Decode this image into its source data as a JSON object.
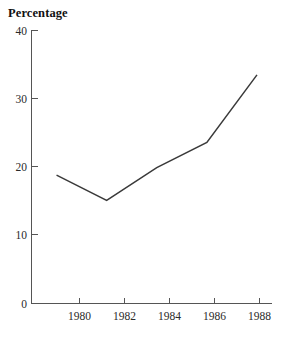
{
  "chart_data": {
    "type": "line",
    "title": "",
    "ylabel": "Percentage",
    "xlabel": "",
    "categories": [
      "1980",
      "1982",
      "1984",
      "1986",
      "1988"
    ],
    "x": [
      1980,
      1982,
      1984,
      1986,
      1988
    ],
    "values": [
      18.8,
      15.1,
      19.9,
      23.6,
      33.5
    ],
    "series": [
      {
        "name": "Percentage",
        "values": [
          18.8,
          15.1,
          19.9,
          23.6,
          33.5
        ]
      }
    ],
    "xlim": [
      1979.0,
      1988.6
    ],
    "ylim": [
      0,
      40
    ],
    "yticks": [
      0,
      10,
      20,
      30,
      40
    ],
    "ytick_labels": [
      "0",
      "10",
      "20",
      "30",
      "40"
    ],
    "xticks": [
      1980,
      1982,
      1984,
      1986,
      1988
    ],
    "xtick_labels": [
      "1980",
      "1982",
      "1984",
      "1986",
      "1988"
    ],
    "grid": false,
    "legend": false,
    "legend_position": "none",
    "tick_direction": "in",
    "line_color": "#3a3a3a",
    "axis_color": "#555555",
    "background_color": "#ffffff",
    "annotations": []
  },
  "labels": {
    "y_axis_title": "Percentage",
    "y_tick_40": "40",
    "y_tick_30": "30",
    "y_tick_20": "20",
    "y_tick_10": "10",
    "y_tick_0": "0",
    "x_tick_1980": "1980",
    "x_tick_1982": "1982",
    "x_tick_1984": "1984",
    "x_tick_1986": "1986",
    "x_tick_1988": "1988"
  }
}
